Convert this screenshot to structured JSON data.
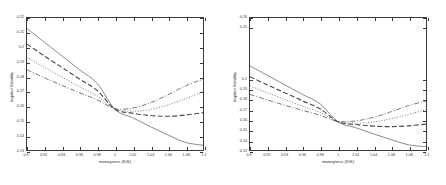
{
  "figure": {
    "background": "#ffffff",
    "axis_color": "#3a3a3a",
    "curve_color": "#4a4a4a"
  },
  "chart_data": [
    {
      "type": "line",
      "panel": "left",
      "title": "",
      "xlabel": "moneyness (K/S)",
      "ylabel": "Implied Volatility",
      "xlim": [
        0.9,
        1.1
      ],
      "ylim": [
        0.13,
        0.22
      ],
      "grid": false,
      "legend": "none",
      "xticks": [
        0.9,
        0.92,
        0.94,
        0.96,
        0.98,
        1,
        1.02,
        1.04,
        1.06,
        1.08,
        1.1
      ],
      "xticklabels": [
        "0.9",
        "0.92",
        "0.94",
        "0.96",
        "0.98",
        "1",
        "1.02",
        "1.04",
        "1.06",
        "1.08",
        "1.1"
      ],
      "yticks": [
        0.13,
        0.14,
        0.15,
        0.16,
        0.17,
        0.18,
        0.19,
        0.2,
        0.21,
        0.22
      ],
      "yticklabels": [
        "0.13",
        "0.14",
        "0.15",
        "0.16",
        "0.17",
        "0.18",
        "0.19",
        "0.2",
        "0.21",
        "0.22"
      ],
      "x": [
        0.9,
        0.92,
        0.94,
        0.96,
        0.98,
        1.0,
        1.02,
        1.04,
        1.06,
        1.08,
        1.1
      ],
      "series": [
        {
          "name": "solid",
          "style": "solid",
          "values": [
            0.2128,
            0.2034,
            0.194,
            0.1846,
            0.1752,
            0.1577,
            0.152,
            0.146,
            0.1403,
            0.1352,
            0.1332
          ]
        },
        {
          "name": "dashed",
          "style": "dashed",
          "values": [
            0.2022,
            0.194,
            0.1862,
            0.1783,
            0.1704,
            0.1578,
            0.1551,
            0.1535,
            0.153,
            0.1538,
            0.1555
          ]
        },
        {
          "name": "dotted",
          "style": "dotted",
          "values": [
            0.1932,
            0.1862,
            0.1796,
            0.1731,
            0.1668,
            0.158,
            0.1565,
            0.1576,
            0.1607,
            0.165,
            0.1697
          ]
        },
        {
          "name": "dashdot",
          "style": "dashdot",
          "values": [
            0.1848,
            0.1792,
            0.174,
            0.169,
            0.1641,
            0.1582,
            0.1586,
            0.1621,
            0.1676,
            0.1737,
            0.1783
          ]
        }
      ]
    },
    {
      "type": "line",
      "panel": "right",
      "title": "",
      "xlabel": "moneyness (K/S)",
      "ylabel": "Implied Volatility",
      "xlim": [
        0.9,
        1.1
      ],
      "ylim": [
        0.13,
        0.26
      ],
      "grid": false,
      "legend": "none",
      "xticks": [
        0.9,
        0.92,
        0.94,
        0.96,
        0.98,
        1,
        1.02,
        1.04,
        1.06,
        1.08,
        1.1
      ],
      "xticklabels": [
        "0.9",
        "0.92",
        "0.94",
        "0.96",
        "0.98",
        "1",
        "1.02",
        "1.04",
        "1.06",
        "1.08",
        "1.1"
      ],
      "yticks": [
        0.13,
        0.14,
        0.15,
        0.16,
        0.17,
        0.18,
        0.19,
        0.2,
        0.25,
        0.26
      ],
      "yticklabels": [
        "0.13",
        "0.14",
        "0.15",
        "0.16",
        "0.17",
        "0.18",
        "0.19",
        "0.2",
        "0.25",
        "0.26"
      ],
      "x": [
        0.9,
        0.92,
        0.94,
        0.96,
        0.98,
        1.0,
        1.02,
        1.04,
        1.06,
        1.08,
        1.1
      ],
      "series": [
        {
          "name": "solid",
          "style": "solid",
          "values": [
            0.2128,
            0.2034,
            0.194,
            0.1846,
            0.1752,
            0.1577,
            0.152,
            0.146,
            0.1403,
            0.1352,
            0.1332
          ]
        },
        {
          "name": "dashed",
          "style": "dashed",
          "values": [
            0.2022,
            0.194,
            0.1862,
            0.1783,
            0.1704,
            0.1578,
            0.1551,
            0.1535,
            0.153,
            0.1538,
            0.1555
          ]
        },
        {
          "name": "dotted",
          "style": "dotted",
          "values": [
            0.1932,
            0.1862,
            0.1796,
            0.1731,
            0.1668,
            0.158,
            0.1565,
            0.1576,
            0.1607,
            0.165,
            0.1697
          ]
        },
        {
          "name": "dashdot",
          "style": "dashdot",
          "values": [
            0.1848,
            0.1792,
            0.174,
            0.169,
            0.1641,
            0.1582,
            0.1586,
            0.1621,
            0.1676,
            0.1737,
            0.1783
          ]
        }
      ]
    }
  ]
}
